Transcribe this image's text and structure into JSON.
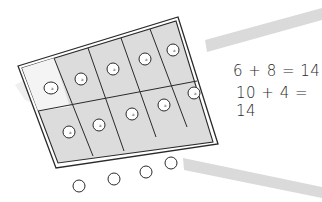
{
  "diagram": {
    "type": "ten-frame",
    "frame": {
      "rows": 2,
      "columns": 5,
      "cells_total": 10,
      "counters_in_frame": 10,
      "shaded_cells": 10,
      "colors": {
        "cell_shade": "#dcdcdc",
        "stroke": "#2a2a2a",
        "band": "#d4d4d4"
      }
    },
    "counters_outside_frame": 4,
    "equations": [
      {
        "text": "6 + 8 = 14"
      },
      {
        "text": "10 + 4 = 14"
      }
    ]
  }
}
